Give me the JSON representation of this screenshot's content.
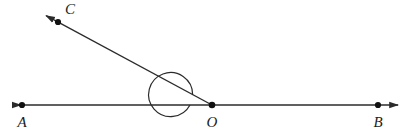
{
  "figure": {
    "type": "geometry-diagram",
    "width": 415,
    "height": 135,
    "background_color": "#ffffff",
    "stroke_color": "#2b2b2b",
    "label_color": "#1c1c1c",
    "stroke_width": 1.4
  },
  "points": {
    "a": {
      "label": "A",
      "x": 22,
      "y": 105,
      "label_x": 22,
      "label_y": 127
    },
    "o": {
      "label": "O",
      "x": 212,
      "y": 105,
      "label_x": 212,
      "label_y": 127
    },
    "b": {
      "label": "B",
      "x": 378,
      "y": 105,
      "label_x": 378,
      "label_y": 127
    },
    "c": {
      "label": "C",
      "x": 58,
      "y": 22,
      "label_x": 70,
      "label_y": 14
    }
  },
  "lines": {
    "ab": {
      "name": "line-ab",
      "x1": 13,
      "y1": 105,
      "x2": 398,
      "y2": 105,
      "arrow_start": true,
      "arrow_end": true
    },
    "oc": {
      "name": "ray-oc",
      "x1": 212,
      "y1": 105,
      "x2": 43,
      "y2": 14,
      "arrow_start": false,
      "arrow_end": true
    }
  },
  "angle_arc": {
    "name": "angle-aoc-arc",
    "vertex_x": 212,
    "vertex_y": 105,
    "radius": 22,
    "path": "M 190 105 A 22 22 0 0 1 192.5 94.6"
  },
  "dot_radius": 3.1
}
